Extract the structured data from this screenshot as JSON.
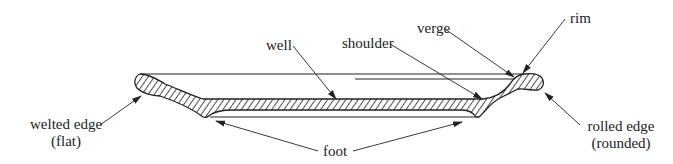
{
  "diagram": {
    "labels": {
      "well": "well",
      "shoulder": "shoulder",
      "verge": "verge",
      "rim": "rim",
      "welted_edge_line1": "welted edge",
      "welted_edge_line2": "(flat)",
      "rolled_edge_line1": "rolled edge",
      "rolled_edge_line2": "(rounded)",
      "foot": "foot"
    },
    "colors": {
      "ink": "#222222",
      "background": "#ffffff"
    }
  }
}
